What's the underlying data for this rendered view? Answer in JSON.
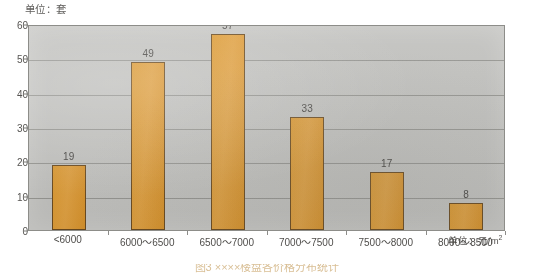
{
  "chart_data": {
    "type": "bar",
    "title": "",
    "subtitle": "",
    "categories": [
      "<6000",
      "6000～6500",
      "6500～7000",
      "7000～7500",
      "7500～8000",
      "8000～8500"
    ],
    "values": [
      19,
      49,
      57,
      33,
      17,
      8
    ],
    "series": [
      {
        "name": "套数",
        "values": [
          19,
          49,
          57,
          33,
          17,
          8
        ]
      }
    ],
    "xlabel": "单位：元/m²",
    "ylabel": "单位：套",
    "ylim": [
      0,
      60
    ],
    "ytick_values": [
      60,
      50,
      40,
      30,
      20,
      10,
      0
    ],
    "ytick_labels": [
      "60",
      "50",
      "40",
      "30",
      "20",
      "10",
      "0"
    ],
    "y_tick_step": 10,
    "grid": true,
    "grid_axis": "y",
    "legend": false,
    "legend_position": "none",
    "data_labels": [
      "19",
      "49",
      "57",
      "33",
      "17",
      "8"
    ],
    "bar_color": "#dc9a33",
    "bar_border_color": "#6b4b20",
    "plot_background": "#c2c2bf",
    "gridline_color": "#8e8e8a",
    "frame_color": "#8d8d89"
  },
  "annotations": {
    "unit_top_left": "单位：套",
    "unit_bottom_right_prefix": "单位：",
    "unit_bottom_right_value": "元/m",
    "unit_bottom_right_exponent": "2"
  },
  "caption": {
    "text": "图3  ××××楼盘各价格分布统计"
  }
}
